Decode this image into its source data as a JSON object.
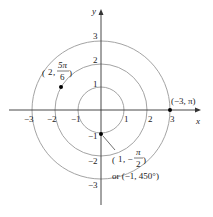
{
  "diagram": {
    "type": "polar-coordinate-plot",
    "axes": {
      "x_label": "x",
      "y_label": "y",
      "x_ticks": [
        "−3",
        "−2",
        "−1",
        "1",
        "2",
        "3"
      ],
      "y_ticks": [
        "3",
        "2",
        "1",
        "−1",
        "−2",
        "−3"
      ]
    },
    "circles": [
      {
        "radius": 1
      },
      {
        "radius": 2
      },
      {
        "radius": 3
      }
    ],
    "points": [
      {
        "name": "point-2-5pi-6",
        "label_r": "2",
        "label_num": "5π",
        "label_den": "6"
      },
      {
        "name": "point-neg3-pi",
        "label": "(−3, π)"
      },
      {
        "name": "point-1-neg-pi-2",
        "label_r": "1",
        "label_num": "π",
        "label_den": "2",
        "alt_label": "or (−1, 450°)"
      }
    ],
    "colors": {
      "circle": "#999999",
      "axis": "#333333",
      "point": "#000000"
    }
  }
}
